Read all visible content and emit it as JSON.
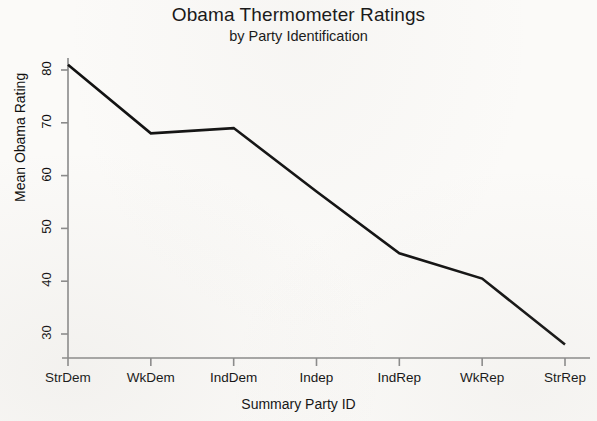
{
  "chart_data": {
    "type": "line",
    "title": "Obama Thermometer Ratings",
    "subtitle": "by Party Identification",
    "xlabel": "Summary Party ID",
    "ylabel": "Mean Obama Rating",
    "categories": [
      "StrDem",
      "WkDem",
      "IndDem",
      "Indep",
      "IndRep",
      "WkRep",
      "StrRep"
    ],
    "values": [
      81,
      68,
      69,
      57,
      45.3,
      40.5,
      28
    ],
    "series": [
      {
        "name": "Mean Obama Rating",
        "values": [
          81,
          68,
          69,
          57,
          45.3,
          40.5,
          28
        ]
      }
    ],
    "ylim": [
      26,
      83
    ],
    "yticks": [
      30,
      40,
      50,
      60,
      70,
      80
    ],
    "ytick_labels": [
      "30",
      "40",
      "50",
      "60",
      "70",
      "80"
    ],
    "xtick_labels": [
      "StrDem",
      "WkDem",
      "IndDem",
      "Indep",
      "IndRep",
      "WkRep",
      "StrRep"
    ],
    "grid": false,
    "legend": false,
    "legend_position": "none",
    "line_color": "#111111",
    "axis_color": "#8a8a8a",
    "background_color": "#fbfaf8",
    "annotations": []
  }
}
